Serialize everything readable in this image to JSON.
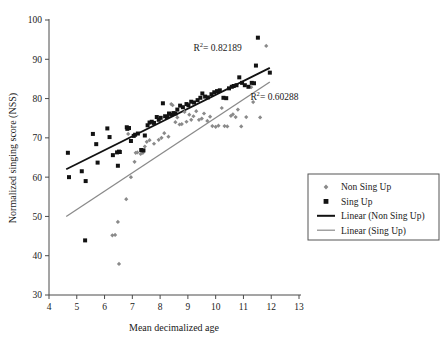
{
  "chart_data": {
    "type": "scatter",
    "title": "",
    "xlabel": "Mean decimalized age",
    "ylabel": "Normalized singing score (NSS)",
    "xlim": [
      4,
      13
    ],
    "ylim": [
      30,
      100
    ],
    "xticks": [
      4,
      5,
      6,
      7,
      8,
      9,
      10,
      11,
      12,
      13
    ],
    "yticks": [
      30,
      40,
      50,
      60,
      70,
      80,
      90,
      100
    ],
    "grid": false,
    "legend_position": "right",
    "annotations": [
      {
        "name": "r2-sing-up",
        "text_prefix": "R",
        "text_sup": "2",
        "text_rest": " = 0.82189",
        "full": "R2 = 0.82189",
        "x": 9.2,
        "y": 92.0
      },
      {
        "name": "r2-non-sing-up",
        "text_prefix": "R",
        "text_sup": "2",
        "text_rest": " = 0.60288",
        "full": "R2 = 0.60288",
        "x": 11.25,
        "y": 79.6
      }
    ],
    "series": [
      {
        "name": "Non Sing Up",
        "marker": "diamond",
        "color": "#8a8a8a",
        "points": [
          [
            6.52,
            37.9
          ],
          [
            6.48,
            48.6
          ],
          [
            6.28,
            45.2
          ],
          [
            6.38,
            45.3
          ],
          [
            6.78,
            54.4
          ],
          [
            6.95,
            60.0
          ],
          [
            7.08,
            63.9
          ],
          [
            7.12,
            66.2
          ],
          [
            7.18,
            66.3
          ],
          [
            7.3,
            65.9
          ],
          [
            7.38,
            66.2
          ],
          [
            7.45,
            67.8
          ],
          [
            7.52,
            69.0
          ],
          [
            6.85,
            71.0
          ],
          [
            7.62,
            69.4
          ],
          [
            7.78,
            68.5
          ],
          [
            7.95,
            69.5
          ],
          [
            8.05,
            70.0
          ],
          [
            8.15,
            71.2
          ],
          [
            8.3,
            70.3
          ],
          [
            8.4,
            78.6
          ],
          [
            8.45,
            78.3
          ],
          [
            8.55,
            74.0
          ],
          [
            8.62,
            75.2
          ],
          [
            8.7,
            73.4
          ],
          [
            8.78,
            73.5
          ],
          [
            8.88,
            76.6
          ],
          [
            8.95,
            74.1
          ],
          [
            9.05,
            75.9
          ],
          [
            9.12,
            74.6
          ],
          [
            9.2,
            75.5
          ],
          [
            9.3,
            76.8
          ],
          [
            9.4,
            74.6
          ],
          [
            9.5,
            74.9
          ],
          [
            9.58,
            76.2
          ],
          [
            9.7,
            74.3
          ],
          [
            9.8,
            75.4
          ],
          [
            9.88,
            73.0
          ],
          [
            10.0,
            72.8
          ],
          [
            10.1,
            73.1
          ],
          [
            10.22,
            77.6
          ],
          [
            10.32,
            73.0
          ],
          [
            10.42,
            72.9
          ],
          [
            10.55,
            75.6
          ],
          [
            10.62,
            76.0
          ],
          [
            10.72,
            75.3
          ],
          [
            10.8,
            77.2
          ],
          [
            10.92,
            72.9
          ],
          [
            11.1,
            75.3
          ],
          [
            11.28,
            82.9
          ],
          [
            11.35,
            79.1
          ],
          [
            11.6,
            75.2
          ],
          [
            11.82,
            93.4
          ]
        ]
      },
      {
        "name": "Sing Up",
        "marker": "square",
        "color": "#121212",
        "points": [
          [
            4.68,
            66.2
          ],
          [
            4.72,
            60.0
          ],
          [
            5.18,
            61.5
          ],
          [
            5.3,
            43.9
          ],
          [
            5.32,
            59.0
          ],
          [
            5.58,
            71.0
          ],
          [
            5.7,
            68.4
          ],
          [
            5.75,
            63.7
          ],
          [
            6.1,
            72.4
          ],
          [
            6.18,
            70.2
          ],
          [
            6.3,
            65.6
          ],
          [
            6.45,
            66.3
          ],
          [
            6.48,
            62.9
          ],
          [
            6.52,
            66.5
          ],
          [
            6.55,
            66.4
          ],
          [
            6.8,
            72.7
          ],
          [
            6.82,
            72.3
          ],
          [
            6.88,
            72.5
          ],
          [
            6.95,
            69.2
          ],
          [
            7.05,
            70.5
          ],
          [
            7.1,
            70.8
          ],
          [
            7.2,
            71.1
          ],
          [
            7.32,
            66.9
          ],
          [
            7.4,
            66.8
          ],
          [
            7.45,
            70.6
          ],
          [
            7.55,
            73.2
          ],
          [
            7.62,
            73.9
          ],
          [
            7.7,
            74.1
          ],
          [
            7.78,
            73.8
          ],
          [
            7.88,
            75.3
          ],
          [
            7.95,
            74.6
          ],
          [
            8.02,
            75.1
          ],
          [
            8.1,
            78.8
          ],
          [
            8.18,
            75.5
          ],
          [
            8.25,
            75.3
          ],
          [
            8.32,
            76.2
          ],
          [
            8.4,
            75.9
          ],
          [
            8.48,
            76.3
          ],
          [
            8.55,
            76.2
          ],
          [
            8.62,
            77.2
          ],
          [
            8.72,
            78.2
          ],
          [
            8.82,
            77.8
          ],
          [
            8.95,
            78.6
          ],
          [
            9.02,
            78.3
          ],
          [
            9.12,
            79.2
          ],
          [
            9.22,
            79.0
          ],
          [
            9.35,
            79.6
          ],
          [
            9.45,
            80.2
          ],
          [
            9.52,
            81.3
          ],
          [
            9.62,
            80.5
          ],
          [
            9.72,
            80.3
          ],
          [
            9.85,
            81.1
          ],
          [
            9.95,
            81.6
          ],
          [
            10.05,
            81.9
          ],
          [
            10.15,
            82.1
          ],
          [
            10.28,
            80.2
          ],
          [
            10.38,
            80.1
          ],
          [
            10.48,
            82.6
          ],
          [
            10.58,
            83.0
          ],
          [
            10.65,
            83.2
          ],
          [
            10.75,
            83.4
          ],
          [
            10.85,
            85.4
          ],
          [
            10.95,
            84.0
          ],
          [
            11.05,
            83.4
          ],
          [
            11.18,
            83.0
          ],
          [
            11.3,
            84.0
          ],
          [
            11.38,
            83.9
          ],
          [
            11.45,
            88.4
          ],
          [
            11.52,
            95.5
          ],
          [
            11.95,
            86.6
          ]
        ]
      }
    ],
    "trendlines": [
      {
        "name": "Linear (Non Sing Up)",
        "color": "#121212",
        "width": 1.8,
        "x0": 4.62,
        "y0": 62.0,
        "x1": 11.95,
        "y1": 87.8
      },
      {
        "name": "Linear (Sing Up)",
        "color": "#8a8a8a",
        "width": 1.3,
        "x0": 4.62,
        "y0": 50.0,
        "x1": 11.95,
        "y1": 84.2
      }
    ],
    "legend": [
      {
        "label": "Non Sing Up",
        "marker": "diamond",
        "color": "#8a8a8a"
      },
      {
        "label": "Sing Up",
        "marker": "square",
        "color": "#121212"
      },
      {
        "label": "Linear (Non Sing Up)",
        "marker": "line-thick",
        "color": "#121212"
      },
      {
        "label": "Linear (Sing Up)",
        "marker": "line-thin",
        "color": "#8a8a8a"
      }
    ]
  }
}
